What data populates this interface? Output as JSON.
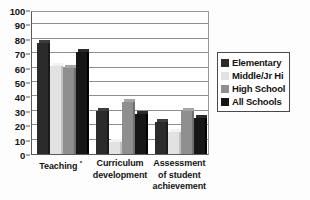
{
  "chart_data": {
    "type": "bar",
    "title": "",
    "xlabel": "",
    "ylabel": "",
    "ylim": [
      0,
      100
    ],
    "yticks": [
      0,
      10,
      20,
      30,
      40,
      50,
      60,
      70,
      80,
      90,
      100
    ],
    "grid": true,
    "legend_position": "right",
    "categories": [
      "Teaching *",
      "Curriculum development",
      "Assessment of student achievement"
    ],
    "category_lines": [
      [
        "Teaching *"
      ],
      [
        "Curriculum",
        "development"
      ],
      [
        "Assessment",
        "of student",
        "achievement"
      ]
    ],
    "series": [
      {
        "name": "Elementary",
        "color": "#2b2b2b",
        "values": [
          77,
          30,
          22
        ]
      },
      {
        "name": "Middle/Jr Hi",
        "color": "#e2e2e2",
        "values": [
          61,
          8,
          15
        ]
      },
      {
        "name": "High School",
        "color": "#8f8f8f",
        "values": [
          60,
          36,
          30
        ]
      },
      {
        "name": "All Schools",
        "color": "#161616",
        "values": [
          71,
          28,
          25
        ]
      }
    ]
  },
  "legend": {
    "items": [
      {
        "label": "Elementary"
      },
      {
        "label": "Middle/Jr Hi"
      },
      {
        "label": "High School"
      },
      {
        "label": "All Schools"
      }
    ]
  }
}
